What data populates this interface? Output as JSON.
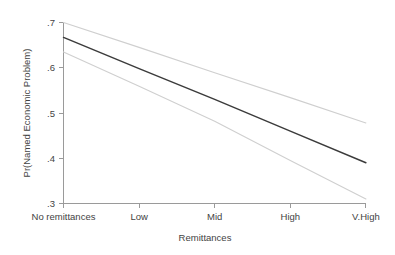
{
  "figure": {
    "background_color": "#ffffff",
    "plot_frame_color": "#9a9a9a"
  },
  "chart_data": {
    "type": "line",
    "title": "",
    "subtitle": "",
    "xlabel": "Remittances",
    "ylabel": "Pr(Named Economic Problem)",
    "categories": [
      "No remittances",
      "Low",
      "Mid",
      "High",
      "V.High"
    ],
    "x": [
      0,
      1,
      2,
      3,
      4
    ],
    "xlim": [
      -0.25,
      4.25
    ],
    "ylim": [
      0.3,
      0.7
    ],
    "yticks": [
      0.7,
      0.6,
      0.5,
      0.4,
      0.3
    ],
    "ytick_labels": [
      ".7",
      ".6",
      ".5",
      ".4",
      ".3"
    ],
    "xtick_labels": [
      "No remittances",
      "Low",
      "Mid",
      "High",
      "V.High"
    ],
    "grid": false,
    "legend": false,
    "legend_position": "none",
    "series": [
      {
        "name": "Upper 95% CI",
        "style": "thin-grey",
        "color": "#cfcfcf",
        "values": [
          0.7,
          0.645,
          0.589,
          0.534,
          0.478
        ]
      },
      {
        "name": "Predicted probability",
        "style": "solid-dark",
        "color": "#3b3b3b",
        "values": [
          0.667,
          0.598,
          0.53,
          0.46,
          0.39
        ]
      },
      {
        "name": "Lower 95% CI",
        "style": "thin-grey",
        "color": "#cfcfcf",
        "values": [
          0.635,
          0.559,
          0.482,
          0.395,
          0.31
        ]
      }
    ]
  },
  "axes": {
    "y_title": "Pr(Named Economic Problem)",
    "x_title": "Remittances",
    "y_tick_labels": [
      ".7",
      ".6",
      ".5",
      ".4",
      ".3"
    ],
    "x_tick_labels": [
      "No remittances",
      "Low",
      "Mid",
      "High",
      "V.High"
    ]
  }
}
